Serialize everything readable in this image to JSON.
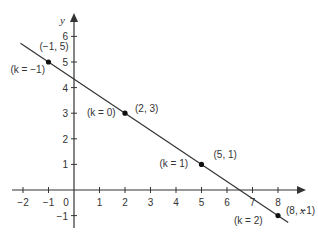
{
  "chart_data": {
    "type": "line",
    "title": "",
    "xlabel": "x",
    "ylabel": "y",
    "xlim": [
      -2.1,
      8.9
    ],
    "ylim": [
      -1.4,
      6.8
    ],
    "grid": false,
    "legend": "none",
    "x_ticks": [
      -2,
      -1,
      0,
      1,
      2,
      3,
      4,
      5,
      6,
      7,
      8
    ],
    "x_tick_labels": [
      "−2",
      "−1",
      "0",
      "1",
      "2",
      "3",
      "4",
      "5",
      "6",
      "7",
      "8"
    ],
    "y_ticks": [
      -1,
      1,
      2,
      3,
      4,
      5,
      6
    ],
    "y_tick_labels": [
      "−1",
      "1",
      "2",
      "3",
      "4",
      "5",
      "6"
    ],
    "series": [
      {
        "name": "line",
        "equation": "y = -(2/3)x + 13/3",
        "x": [
          -2.1,
          8.4
        ],
        "y": [
          5.73,
          -1.27
        ]
      }
    ],
    "points": [
      {
        "x": -1,
        "y": 5,
        "label": "(−1, 5)",
        "k_label": "(k = −1)"
      },
      {
        "x": 2,
        "y": 3,
        "label": "(2, 3)",
        "k_label": "(k = 0)"
      },
      {
        "x": 5,
        "y": 1,
        "label": "(5, 1)",
        "k_label": "(k = 1)"
      },
      {
        "x": 8,
        "y": -1,
        "label": "(8, −1)",
        "k_label": "(k = 2)"
      }
    ]
  },
  "colors": {
    "axis": "#333333",
    "line": "#333333",
    "point": "#111111",
    "background": "#ffffff"
  }
}
